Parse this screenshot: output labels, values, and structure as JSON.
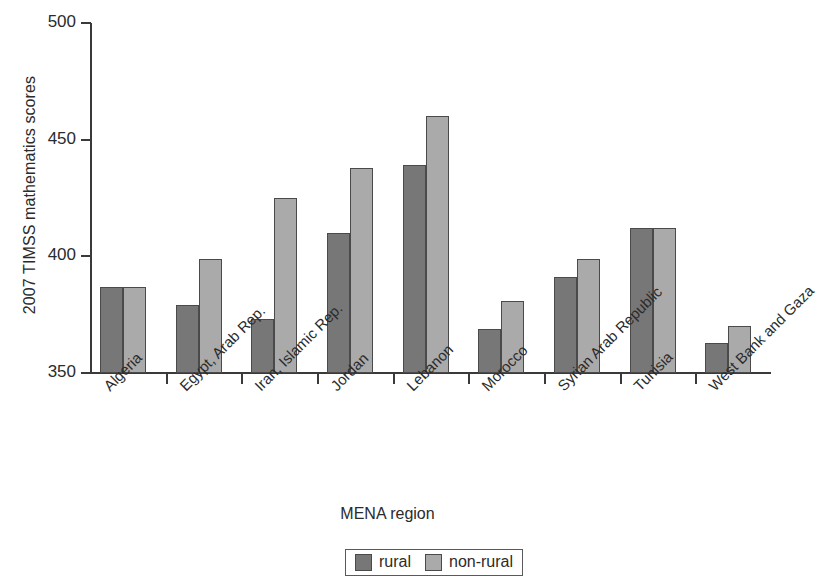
{
  "chart_data": {
    "type": "bar",
    "title": "",
    "xlabel": "MENA region",
    "ylabel": "2007 TIMSS mathematics scores",
    "ylim": [
      350,
      500
    ],
    "yticks": [
      350,
      400,
      450,
      500
    ],
    "grid": false,
    "legend_position": "bottom",
    "categories": [
      "Algeria",
      "Egypt, Arab Rep.",
      "Iran, Islamic Rep.",
      "Jordan",
      "Lebanon",
      "Morocco",
      "Syrian Arab Republic",
      "Tunisia",
      "West Bank and Gaza"
    ],
    "series": [
      {
        "name": "rural",
        "color": "#777777",
        "values": [
          387,
          379,
          373,
          410,
          439,
          369,
          391,
          412,
          363
        ]
      },
      {
        "name": "non-rural",
        "color": "#aaaaaa",
        "values": [
          387,
          399,
          425,
          438,
          460,
          381,
          399,
          412,
          370
        ]
      }
    ]
  },
  "axis": {
    "y_tick_labels": [
      "500",
      "450",
      "400",
      "350"
    ]
  },
  "legend": {
    "items": [
      {
        "label": "rural",
        "swatch": "rural-swatch"
      },
      {
        "label": "non-rural",
        "swatch": "non-rural-swatch"
      }
    ]
  }
}
